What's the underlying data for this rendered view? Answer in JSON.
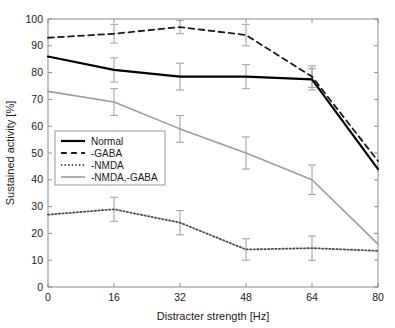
{
  "chart_data": {
    "type": "line",
    "title": "",
    "xlabel": "Distracter strength [Hz]",
    "ylabel": "Sustained activity [%]",
    "x": [
      0,
      16,
      32,
      48,
      64,
      80
    ],
    "xlim": [
      0,
      80
    ],
    "ylim": [
      0,
      100
    ],
    "xticks": [
      0,
      16,
      32,
      48,
      64,
      80
    ],
    "yticks": [
      0,
      10,
      20,
      30,
      40,
      50,
      60,
      70,
      80,
      90,
      100
    ],
    "xtick_labels": [
      "0",
      "16",
      "32",
      "48",
      "64",
      "80"
    ],
    "ytick_labels": [
      "0",
      "10",
      "20",
      "30",
      "40",
      "50",
      "60",
      "70",
      "80",
      "90",
      "100"
    ],
    "grid": false,
    "legend_position": "lower left",
    "series": [
      {
        "name": "Normal",
        "style": "solid",
        "color": "#000000",
        "width": 2.2,
        "values": [
          86,
          81,
          78.5,
          78.5,
          77.5,
          44
        ],
        "errors": [
          0,
          4.5,
          5,
          4.5,
          4,
          0
        ]
      },
      {
        "name": "-GABA",
        "style": "dashed",
        "color": "#1a1a1a",
        "width": 1.8,
        "values": [
          93,
          94.5,
          97,
          94,
          78.5,
          47
        ],
        "errors": [
          0,
          3.5,
          2.5,
          4,
          4,
          0
        ]
      },
      {
        "name": "-NMDA",
        "style": "dotted",
        "color": "#4d4d4d",
        "width": 1.8,
        "values": [
          27,
          29,
          24,
          14,
          14.5,
          13.5
        ],
        "errors": [
          0,
          4.5,
          4.5,
          4,
          4.5,
          0
        ]
      },
      {
        "name": "-NMDA,-GABA",
        "style": "solid",
        "color": "#9c9c9c",
        "width": 1.6,
        "values": [
          73,
          69,
          59,
          50,
          40,
          16
        ],
        "errors": [
          0,
          5,
          5,
          6,
          5.5,
          0
        ]
      }
    ]
  },
  "legend": {
    "items": [
      {
        "label": "Normal"
      },
      {
        "label": "-GABA"
      },
      {
        "label": "-NMDA"
      },
      {
        "label": "-NMDA,-GABA"
      }
    ]
  },
  "axes": {
    "x_title": "Distracter strength [Hz]",
    "y_title": "Sustained activity [%]"
  }
}
